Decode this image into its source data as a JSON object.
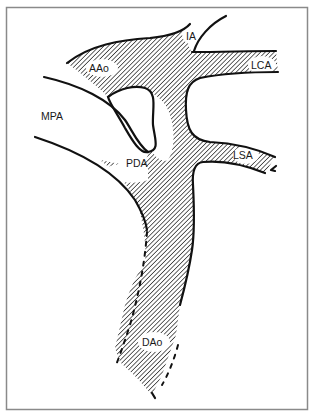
{
  "figure": {
    "type": "anatomical-schematic",
    "frame_color": "#8a8a8a",
    "ink_color": "#111111",
    "hatch": {
      "direction": "diagonal-down-right",
      "spacing_px": 3,
      "color": "#111111"
    }
  },
  "labels": {
    "ia": "IA",
    "aao": "AAo",
    "lca": "LCA",
    "mpa": "MPA",
    "lsa": "LSA",
    "pda": "PDA",
    "dao": "DAo"
  },
  "structures": [
    {
      "id": "ia",
      "label": "IA",
      "hatched": true
    },
    {
      "id": "aao",
      "label": "AAo",
      "hatched": true
    },
    {
      "id": "lca",
      "label": "LCA",
      "hatched": true
    },
    {
      "id": "mpa",
      "label": "MPA",
      "hatched": false
    },
    {
      "id": "lsa",
      "label": "LSA",
      "hatched": true
    },
    {
      "id": "pda",
      "label": "PDA",
      "hatched": true
    },
    {
      "id": "dao",
      "label": "DAo",
      "hatched": true
    }
  ]
}
